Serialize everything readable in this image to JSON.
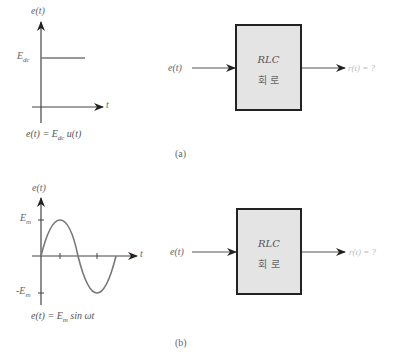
{
  "panel_a": {
    "caption": "(a)",
    "plot": {
      "y_axis_label": "e(t)",
      "x_axis_label": "t",
      "level_label_main": "E",
      "level_label_sub": "dc",
      "equation_lhs": "e(t) = E",
      "equation_sub": "dc",
      "equation_rhs": " u(t)"
    },
    "block": {
      "input_label": "e(t)",
      "title": "RLC",
      "subtitle": "회 로",
      "output_label": "r(t) = ?"
    }
  },
  "panel_b": {
    "caption": "(b)",
    "plot": {
      "y_axis_label": "e(t)",
      "x_axis_label": "t",
      "pos_label_main": "E",
      "pos_label_sub": "m",
      "neg_label_main": "-E",
      "neg_label_sub": "m",
      "equation_lhs": "e(t) = E",
      "equation_sub": "m",
      "equation_rhs": " sin ωt"
    },
    "block": {
      "input_label": "e(t)",
      "title": "RLC",
      "subtitle": "회 로",
      "output_label": "r(t) = ?"
    }
  },
  "colors": {
    "axis": "#222222",
    "curve": "#777777",
    "box_fill": "#e4e4e4",
    "box_border": "#222222",
    "output_text": "#bbbbbb"
  }
}
